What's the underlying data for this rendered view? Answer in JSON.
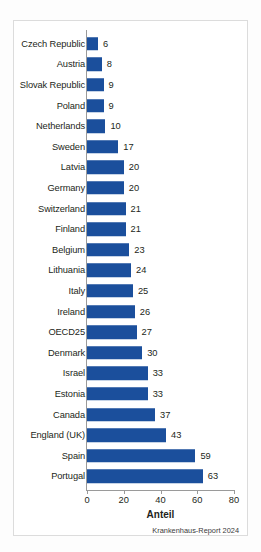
{
  "chart_data": {
    "type": "bar",
    "orientation": "horizontal",
    "title": "",
    "subtitle": "",
    "xlabel": "Anteil",
    "ylabel": "",
    "xlim": [
      0,
      80
    ],
    "xticks": [
      0,
      20,
      40,
      60,
      80
    ],
    "xtick_labels": [
      "0",
      "20",
      "40",
      "60",
      "80"
    ],
    "grid": false,
    "legend": null,
    "source_note": "Krankenhaus-Report 2024",
    "bar_color": "#1b4f9c",
    "axis_color": "#9a9a9a",
    "categories": [
      "Czech Republic",
      "Austria",
      "Slovak Republic",
      "Poland",
      "Netherlands",
      "Sweden",
      "Latvia",
      "Germany",
      "Switzerland",
      "Finland",
      "Belgium",
      "Lithuania",
      "Italy",
      "Ireland",
      "OECD25",
      "Denmark",
      "Israel",
      "Estonia",
      "Canada",
      "England (UK)",
      "Spain",
      "Portugal"
    ],
    "values": [
      6,
      8,
      9,
      9,
      10,
      17,
      20,
      20,
      21,
      21,
      23,
      24,
      25,
      26,
      27,
      30,
      33,
      33,
      37,
      43,
      59,
      63
    ],
    "value_labels": [
      "6",
      "8",
      "9",
      "9",
      "10",
      "17",
      "20",
      "20",
      "21",
      "21",
      "23",
      "24",
      "25",
      "26",
      "27",
      "30",
      "33",
      "33",
      "37",
      "43",
      "59",
      "63"
    ]
  }
}
